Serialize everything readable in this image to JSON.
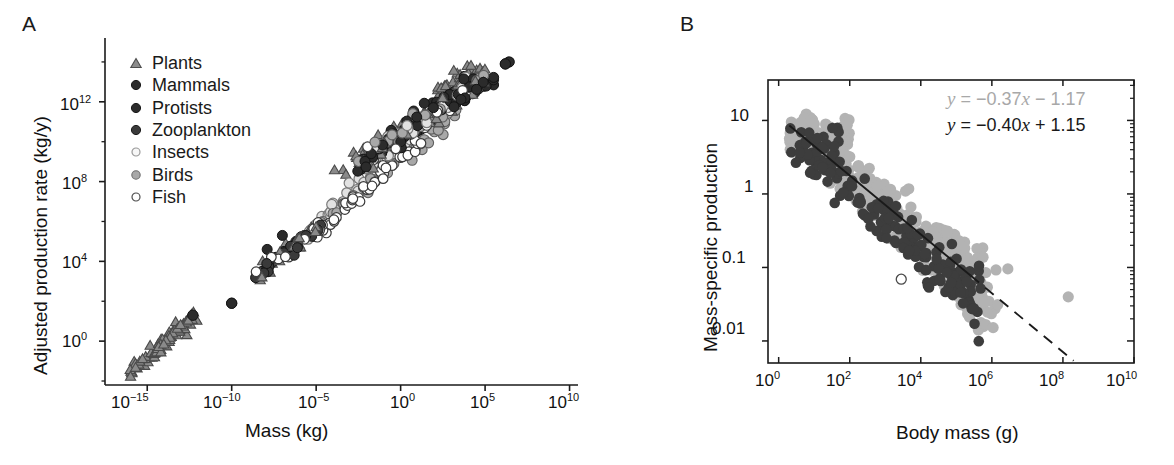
{
  "figure": {
    "panelA_label": "A",
    "panelB_label": "B"
  },
  "panelA": {
    "xlabel": "Mass (kg)",
    "ylabel": "Adjusted production rate (kg/y)",
    "xticks": [
      "10-15",
      "10-10",
      "10-5",
      "100",
      "105",
      "1010"
    ],
    "xtick_base": [
      "10",
      "10",
      "10",
      "10",
      "10",
      "10"
    ],
    "xtick_exp": [
      "−15",
      "−10",
      "−5",
      "0",
      "5",
      "10"
    ],
    "ytick_base": [
      "10",
      "10",
      "10",
      "10"
    ],
    "ytick_exp": [
      "0",
      "4",
      "8",
      "12"
    ],
    "legend": [
      {
        "label": "Plants",
        "marker": "triangle-open-gray",
        "fill": "#8c8c8c",
        "stroke": "#555555"
      },
      {
        "label": "Mammals",
        "marker": "circle-filled-dark",
        "fill": "#2b2b2b",
        "stroke": "#1a1a1a"
      },
      {
        "label": "Protists",
        "marker": "circle-filled-dark",
        "fill": "#2b2b2b",
        "stroke": "#1a1a1a"
      },
      {
        "label": "Zooplankton",
        "marker": "circle-filled-dark",
        "fill": "#3a3a3a",
        "stroke": "#1a1a1a"
      },
      {
        "label": "Insects",
        "marker": "circle-open-light",
        "fill": "#f2f2f2",
        "stroke": "#8a8a8a"
      },
      {
        "label": "Birds",
        "marker": "circle-filled-gray",
        "fill": "#a8a8a8",
        "stroke": "#6e6e6e"
      },
      {
        "label": "Fish",
        "marker": "circle-open-white",
        "fill": "#ffffff",
        "stroke": "#4d4d4d"
      }
    ]
  },
  "panelB": {
    "xlabel": "Body mass (g)",
    "ylabel": "Mass-specific production",
    "xtick_base": [
      "10",
      "10",
      "10",
      "10",
      "10",
      "10"
    ],
    "xtick_exp": [
      "0",
      "2",
      "4",
      "6",
      "8",
      "10"
    ],
    "yticks": [
      "10",
      "1",
      "0.1",
      "0.01"
    ],
    "equation_gray": "y = −0.37x − 1.17",
    "equation_gray_lhs": "y",
    "equation_gray_rhs": " = −0.37",
    "equation_gray_x": "x",
    "equation_gray_tail": " − 1.17",
    "equation_black": "y = −0.40x + 1.15",
    "equation_black_rhs": " = −0.40",
    "equation_black_tail": " + 1.15",
    "colors": {
      "gray_points": "#b3b3b3",
      "dark_points": "#3d3d3d",
      "line": "#1a1a1a"
    }
  },
  "chart_data": [
    {
      "type": "scatter",
      "panel": "A",
      "title": "",
      "xlabel": "Mass (kg)",
      "ylabel": "Adjusted production rate (kg/y)",
      "xscale": "log10",
      "yscale": "log10",
      "xlim": [
        -17.5,
        10.5
      ],
      "ylim": [
        -2.2,
        15.2
      ],
      "xticks": [
        -15,
        -10,
        -5,
        0,
        5,
        10
      ],
      "yticks": [
        0,
        4,
        8,
        12
      ],
      "grid": false,
      "legend_position": "upper-left-inside",
      "series": [
        {
          "name": "Plants",
          "marker": "triangle",
          "color": "#8c8c8c",
          "points": [
            [
              -15.9,
              -1.55
            ],
            [
              -15.6,
              -1.35
            ],
            [
              -15.35,
              -1.15
            ],
            [
              -15.1,
              -0.95
            ],
            [
              -14.9,
              -0.8
            ],
            [
              -14.7,
              -0.6
            ],
            [
              -14.5,
              -0.45
            ],
            [
              -14.3,
              -0.3
            ],
            [
              -14.1,
              -0.15
            ],
            [
              -13.95,
              0.0
            ],
            [
              -13.8,
              0.12
            ],
            [
              -13.6,
              0.25
            ],
            [
              -13.45,
              0.38
            ],
            [
              -13.3,
              0.5
            ],
            [
              -13.15,
              0.62
            ],
            [
              -13.0,
              0.75
            ],
            [
              -12.85,
              0.88
            ],
            [
              -12.7,
              1.0
            ],
            [
              -12.5,
              1.15
            ],
            [
              -12.35,
              1.3
            ],
            [
              -7.6,
              3.9
            ],
            [
              -7.1,
              4.2
            ],
            [
              -6.6,
              4.5
            ],
            [
              -6.0,
              4.85
            ],
            [
              -5.4,
              5.2
            ],
            [
              -4.8,
              5.6
            ],
            [
              -3.4,
              8.6
            ],
            [
              -2.6,
              9.2
            ],
            [
              -2.0,
              9.5
            ],
            [
              -1.5,
              9.8
            ],
            [
              -1.0,
              10.1
            ],
            [
              -0.4,
              10.5
            ],
            [
              0.2,
              10.9
            ],
            [
              0.8,
              11.2
            ],
            [
              1.4,
              11.5
            ],
            [
              2.0,
              11.8
            ],
            [
              2.5,
              12.0
            ],
            [
              3.0,
              12.3
            ],
            [
              3.4,
              12.5
            ],
            [
              3.8,
              12.7
            ],
            [
              4.1,
              12.85
            ],
            [
              4.4,
              13.0
            ],
            [
              4.7,
              13.1
            ],
            [
              2.2,
              12.6
            ],
            [
              2.6,
              12.8
            ],
            [
              3.1,
              13.0
            ],
            [
              3.5,
              13.2
            ],
            [
              3.9,
              13.35
            ],
            [
              4.2,
              13.5
            ],
            [
              4.5,
              13.6
            ]
          ]
        },
        {
          "name": "Mammals",
          "marker": "circle",
          "color": "#2b2b2b",
          "points": [
            [
              -2.0,
              8.9
            ],
            [
              -1.4,
              9.3
            ],
            [
              -0.8,
              9.7
            ],
            [
              -0.2,
              10.0
            ],
            [
              0.4,
              10.4
            ],
            [
              1.0,
              10.7
            ],
            [
              1.6,
              11.0
            ],
            [
              2.2,
              11.4
            ],
            [
              2.8,
              11.7
            ],
            [
              3.3,
              12.0
            ],
            [
              3.8,
              12.3
            ],
            [
              4.2,
              12.5
            ],
            [
              4.6,
              12.7
            ],
            [
              5.0,
              12.9
            ],
            [
              5.5,
              13.1
            ],
            [
              6.2,
              13.9
            ]
          ]
        },
        {
          "name": "Protists",
          "marker": "circle",
          "color": "#2b2b2b",
          "points": [
            [
              -12.4,
              1.15
            ],
            [
              -10.0,
              1.9
            ],
            [
              -7.9,
              4.6
            ],
            [
              -7.0,
              5.3
            ],
            [
              -6.2,
              5.0
            ],
            [
              -7.4,
              4.2
            ],
            [
              -8.0,
              3.6
            ],
            [
              -8.3,
              3.3
            ]
          ]
        },
        {
          "name": "Zooplankton",
          "marker": "circle",
          "color": "#3a3a3a",
          "points": [
            [
              -8.4,
              3.3
            ],
            [
              -8.2,
              3.5
            ],
            [
              -7.9,
              3.7
            ],
            [
              -7.6,
              3.95
            ],
            [
              -7.3,
              4.2
            ],
            [
              -6.9,
              4.5
            ],
            [
              -6.5,
              4.75
            ],
            [
              -6.1,
              5.0
            ],
            [
              -5.7,
              5.3
            ],
            [
              -5.3,
              5.6
            ]
          ]
        },
        {
          "name": "Insects",
          "marker": "circle-open",
          "color": "#d9d9d9",
          "points": [
            [
              -5.4,
              5.5
            ],
            [
              -5.0,
              5.85
            ],
            [
              -4.6,
              6.1
            ],
            [
              -4.2,
              6.4
            ],
            [
              -3.8,
              6.7
            ],
            [
              -3.4,
              7.0
            ],
            [
              -3.0,
              7.3
            ],
            [
              -2.6,
              7.6
            ],
            [
              -2.2,
              7.9
            ],
            [
              -1.8,
              8.2
            ],
            [
              -1.4,
              8.5
            ],
            [
              -1.0,
              8.8
            ],
            [
              -0.6,
              9.1
            ],
            [
              -0.2,
              9.4
            ],
            [
              0.3,
              9.7
            ],
            [
              0.8,
              10.0
            ]
          ]
        },
        {
          "name": "Birds",
          "marker": "circle",
          "color": "#a8a8a8",
          "points": [
            [
              -4.6,
              6.0
            ],
            [
              -4.0,
              6.4
            ],
            [
              -3.4,
              6.9
            ],
            [
              -2.8,
              7.3
            ],
            [
              -2.2,
              7.7
            ],
            [
              -1.6,
              8.1
            ],
            [
              -1.0,
              8.5
            ],
            [
              -0.4,
              8.9
            ],
            [
              0.2,
              9.3
            ],
            [
              0.8,
              9.7
            ],
            [
              1.4,
              10.1
            ],
            [
              2.0,
              10.5
            ],
            [
              2.6,
              10.9
            ],
            [
              3.2,
              11.3
            ]
          ]
        },
        {
          "name": "Fish",
          "marker": "circle-open",
          "color": "#ffffff",
          "points": [
            [
              -5.0,
              5.3
            ],
            [
              -4.6,
              5.6
            ],
            [
              -4.2,
              5.9
            ],
            [
              -3.8,
              6.2
            ],
            [
              -3.3,
              6.6
            ],
            [
              -2.9,
              6.9
            ],
            [
              -2.5,
              7.2
            ],
            [
              -2.0,
              7.6
            ],
            [
              -1.5,
              8.0
            ],
            [
              -1.0,
              8.4
            ],
            [
              -0.5,
              8.8
            ],
            [
              0.0,
              9.2
            ],
            [
              0.5,
              9.5
            ],
            [
              1.0,
              9.9
            ]
          ]
        }
      ]
    },
    {
      "type": "scatter",
      "panel": "B",
      "title": "",
      "xlabel": "Body mass (g)",
      "ylabel": "Mass-specific production",
      "xscale": "log10",
      "yscale": "log10",
      "xlim": [
        -0.3,
        10.0
      ],
      "ylim": [
        -2.3,
        1.55
      ],
      "xticks": [
        0,
        2,
        4,
        6,
        8,
        10
      ],
      "yticks": [
        -2,
        -1,
        0,
        1
      ],
      "ytick_labels": [
        "0.01",
        "0.1",
        "1",
        "10"
      ],
      "grid": false,
      "annotations": [
        {
          "text": "y = −0.37x − 1.17",
          "color": "#a8a8a8",
          "x": 5.6,
          "y": 1.42
        },
        {
          "text": "y = −0.40x + 1.15",
          "color": "#1a1a1a",
          "x": 5.6,
          "y": 1.18
        }
      ],
      "fits": [
        {
          "name": "all-data fit",
          "slope": -0.4,
          "intercept": 1.15,
          "style": "solid-then-dashed",
          "x_solid": [
            0.3,
            5.4
          ],
          "x_dashed": [
            5.4,
            8.3
          ],
          "color": "#1a1a1a"
        },
        {
          "name": "gray subset fit",
          "slope": -0.37,
          "intercept": -1.17,
          "color": "#a8a8a8"
        }
      ],
      "series": [
        {
          "name": "gray points",
          "marker": "circle",
          "color": "#b3b3b3",
          "count": 310
        },
        {
          "name": "dark points",
          "marker": "circle",
          "color": "#3d3d3d",
          "count": 150
        },
        {
          "name": "open point",
          "marker": "circle-open",
          "color": "#ffffff",
          "count": 1
        }
      ]
    }
  ]
}
